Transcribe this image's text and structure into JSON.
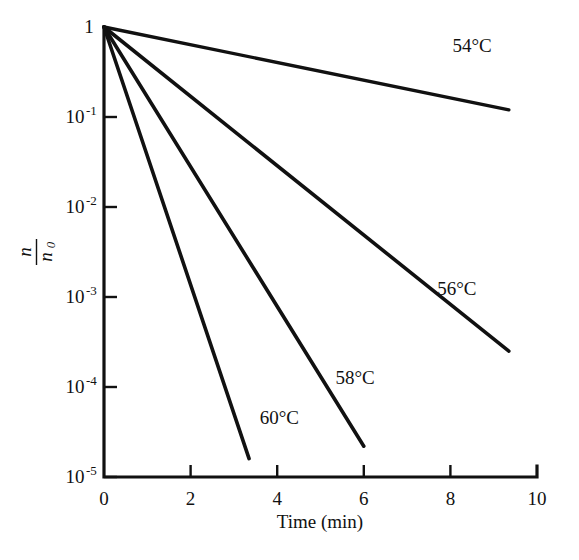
{
  "chart_data": {
    "type": "line",
    "title": "",
    "subtitle": "",
    "xlabel": "Time (min)",
    "ylabel": "n/n0",
    "ylabel_numerator": "n",
    "ylabel_denominator_base": "n",
    "ylabel_denominator_sub": "0",
    "yscale": "log",
    "xscale": "linear",
    "xlim": [
      0,
      10
    ],
    "ylim": [
      1e-05,
      1
    ],
    "grid": false,
    "legend_position": "inline-annotations",
    "xticks": [
      0,
      2,
      4,
      6,
      8,
      10
    ],
    "xticklabels": [
      "0",
      "2",
      "4",
      "6",
      "8",
      "10"
    ],
    "yticks": [
      1,
      0.1,
      0.01,
      0.001,
      0.0001,
      1e-05
    ],
    "yticklabels": [
      "1",
      "10-1",
      "10-2",
      "10-3",
      "10-4",
      "10-5"
    ],
    "ytick_mantissa": [
      "1",
      "10",
      "10",
      "10",
      "10",
      "10"
    ],
    "ytick_exponent": [
      "",
      "-1",
      "-2",
      "-3",
      "-4",
      "-5"
    ],
    "line_color": "#111111",
    "series": [
      {
        "name": "54°C",
        "label": "54°C",
        "color": "#111111",
        "stroke_width": 3.4,
        "x": [
          0,
          9.35
        ],
        "y": [
          1,
          0.12
        ],
        "decay_decades_per_min": 0.0983,
        "label_x": 8.5,
        "label_y": 0.53
      },
      {
        "name": "56°C",
        "label": "56°C",
        "color": "#111111",
        "stroke_width": 3.6,
        "x": [
          0,
          9.35
        ],
        "y": [
          1,
          0.00025
        ],
        "decay_decades_per_min": 0.3856,
        "label_x": 8.15,
        "label_y": 0.00105
      },
      {
        "name": "58°C",
        "label": "58°C",
        "color": "#111111",
        "stroke_width": 3.6,
        "x": [
          0,
          6.0
        ],
        "y": [
          1,
          2.2e-05
        ],
        "decay_decades_per_min": 0.7745,
        "label_x": 5.8,
        "label_y": 0.000108
      },
      {
        "name": "60°C",
        "label": "60°C",
        "color": "#111111",
        "stroke_width": 3.6,
        "x": [
          0,
          3.35
        ],
        "y": [
          1,
          1.6e-05
        ],
        "decay_decades_per_min": 1.4385,
        "label_x": 4.05,
        "label_y": 3.85e-05
      }
    ]
  },
  "figure": {
    "background": "#ffffff",
    "axis_color": "#111111"
  }
}
